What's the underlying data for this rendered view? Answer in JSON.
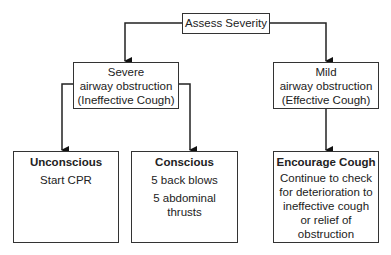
{
  "root": {
    "label": "Assess Severity"
  },
  "branches": [
    {
      "label_lines": [
        "Severe",
        "airway obstruction",
        "(Ineffective Cough)"
      ],
      "children": [
        {
          "title": "Unconscious",
          "lines": [
            "Start CPR"
          ]
        },
        {
          "title": "Conscious",
          "lines": [
            "5 back blows",
            "5 abdominal thrusts"
          ]
        }
      ]
    },
    {
      "label_lines": [
        "Mild",
        "airway obstruction",
        "(Effective Cough)"
      ],
      "children": [
        {
          "title": "Encourage Cough",
          "lines": [
            "Continue to check",
            "for deterioration to",
            "ineffective cough",
            "or relief of",
            "obstruction"
          ]
        }
      ]
    }
  ]
}
